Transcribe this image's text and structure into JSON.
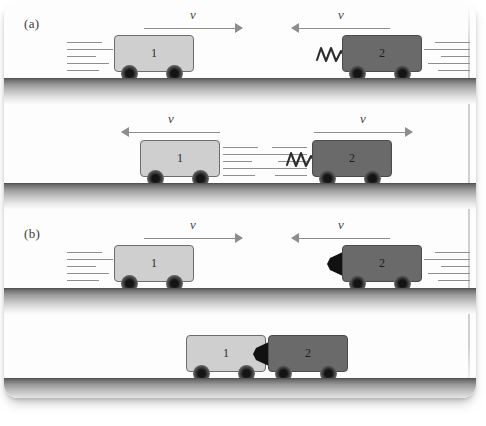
{
  "figure": {
    "panels": [
      {
        "id": "a",
        "label": "(a)",
        "collision_type": "elastic",
        "bumper": "spring",
        "rows": [
          {
            "stage": "before",
            "carts": [
              {
                "number": "1",
                "shade": "light",
                "direction": "right",
                "velocity_label": "v",
                "speed_lines": "left"
              },
              {
                "number": "2",
                "shade": "dark",
                "direction": "left",
                "velocity_label": "v",
                "speed_lines": "right",
                "bumper": "spring"
              }
            ]
          },
          {
            "stage": "after",
            "carts": [
              {
                "number": "1",
                "shade": "light",
                "direction": "left",
                "velocity_label": "v",
                "speed_lines": "right"
              },
              {
                "number": "2",
                "shade": "dark",
                "direction": "right",
                "velocity_label": "v",
                "speed_lines": "left",
                "bumper": "spring"
              }
            ]
          }
        ]
      },
      {
        "id": "b",
        "label": "(b)",
        "collision_type": "perfectly-inelastic",
        "bumper": "adhesive-wedge",
        "rows": [
          {
            "stage": "before",
            "carts": [
              {
                "number": "1",
                "shade": "light",
                "direction": "right",
                "velocity_label": "v",
                "speed_lines": "left"
              },
              {
                "number": "2",
                "shade": "dark",
                "direction": "left",
                "velocity_label": "v",
                "speed_lines": "right",
                "bumper": "wedge"
              }
            ]
          },
          {
            "stage": "after",
            "carts": [
              {
                "number": "1",
                "shade": "light",
                "direction": "none",
                "velocity_label": "",
                "speed_lines": "none"
              },
              {
                "number": "2",
                "shade": "dark",
                "direction": "none",
                "velocity_label": "",
                "speed_lines": "none",
                "bumper": "wedge"
              }
            ]
          }
        ]
      }
    ],
    "colors": {
      "cart_light": "#cfcfcf",
      "cart_dark": "#6a6a6a",
      "wheel": "#141414",
      "ground_top": "#4c4c4c",
      "arrow": "#8d8d8d",
      "ink": "#3b3b3b",
      "page": "#fdfdfd"
    }
  }
}
